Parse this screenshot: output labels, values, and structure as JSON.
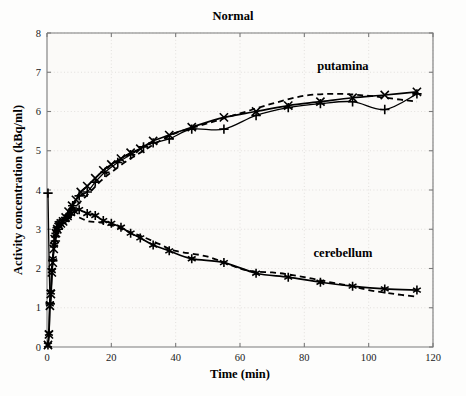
{
  "chart_data": {
    "type": "line",
    "title": "Normal",
    "xlabel": "Time (min)",
    "ylabel": "Activity concentration (kBq/ml)",
    "xlim": [
      0,
      120
    ],
    "ylim": [
      0,
      8
    ],
    "xticks": [
      0,
      20,
      40,
      60,
      80,
      100,
      120
    ],
    "yticks": [
      0,
      1,
      2,
      3,
      4,
      5,
      6,
      7,
      8
    ],
    "grid": true,
    "legend": "annotations-on-plot",
    "annotations": [
      {
        "text": "putamina",
        "x": 92,
        "y": 7.05
      },
      {
        "text": "cerebellum",
        "x": 92,
        "y": 2.3
      }
    ],
    "series": [
      {
        "name": "putamina measured (x)",
        "marker": "x",
        "linestyle": "solid",
        "x": [
          0.3,
          0.6,
          0.9,
          1.2,
          1.5,
          1.8,
          2.1,
          2.4,
          2.8,
          3.2,
          3.7,
          4.3,
          5.0,
          5.8,
          6.7,
          7.8,
          9.0,
          10.5,
          12.5,
          15,
          17.5,
          20,
          23,
          26,
          29,
          33,
          38,
          45,
          55,
          65,
          75,
          85,
          95,
          105,
          115
        ],
        "y": [
          0.05,
          0.32,
          1.05,
          1.35,
          1.9,
          2.15,
          2.5,
          2.75,
          2.9,
          3.0,
          3.1,
          3.15,
          3.2,
          3.3,
          3.45,
          3.6,
          3.75,
          3.95,
          4.1,
          4.3,
          4.5,
          4.65,
          4.8,
          4.95,
          5.05,
          5.25,
          5.4,
          5.6,
          5.85,
          6.0,
          6.15,
          6.25,
          6.35,
          6.42,
          6.5
        ]
      },
      {
        "name": "putamina model (+)",
        "marker": "+",
        "linestyle": "solid",
        "x": [
          0.3,
          1.0,
          1.8,
          2.6,
          3.5,
          4.5,
          6.0,
          8.0,
          10.0,
          12.5,
          15,
          18,
          22,
          26,
          30,
          33,
          38,
          45,
          55,
          65,
          75,
          85,
          95,
          105,
          115
        ],
        "y": [
          3.92,
          1.1,
          2.2,
          2.7,
          3.0,
          3.15,
          3.3,
          3.6,
          3.85,
          3.95,
          4.2,
          4.45,
          4.7,
          4.9,
          5.1,
          5.2,
          5.3,
          5.55,
          5.55,
          5.9,
          6.1,
          6.2,
          6.25,
          6.05,
          6.45
        ]
      },
      {
        "name": "putamina dashed fit",
        "marker": "none",
        "linestyle": "dashed",
        "x": [
          5,
          8,
          11,
          14,
          17,
          20,
          25,
          30,
          35,
          40,
          50,
          60,
          70,
          80,
          90,
          100,
          110,
          115
        ],
        "y": [
          3.25,
          3.5,
          3.75,
          4.0,
          4.25,
          4.45,
          4.75,
          5.0,
          5.25,
          5.45,
          5.7,
          5.95,
          6.2,
          6.4,
          6.45,
          6.4,
          6.3,
          6.25
        ]
      },
      {
        "name": "cerebellum measured (*)",
        "marker": "*",
        "linestyle": "solid",
        "x": [
          0.3,
          0.6,
          0.9,
          1.2,
          1.5,
          1.8,
          2.2,
          2.6,
          3.0,
          3.5,
          4.0,
          4.8,
          5.6,
          6.5,
          7.5,
          8.5,
          10,
          12.5,
          15,
          17.5,
          20,
          23,
          26,
          29,
          33,
          38,
          45,
          55,
          65,
          75,
          85,
          95,
          105,
          115
        ],
        "y": [
          0.05,
          0.35,
          1.1,
          1.4,
          1.95,
          2.25,
          2.6,
          2.85,
          3.0,
          3.1,
          3.15,
          3.2,
          3.25,
          3.3,
          3.4,
          3.45,
          3.5,
          3.4,
          3.35,
          3.22,
          3.15,
          3.05,
          2.9,
          2.78,
          2.6,
          2.45,
          2.25,
          2.15,
          1.88,
          1.78,
          1.65,
          1.55,
          1.48,
          1.45
        ]
      },
      {
        "name": "cerebellum dashed fit",
        "marker": "none",
        "linestyle": "dashed",
        "x": [
          10,
          13,
          16,
          20,
          25,
          30,
          35,
          40,
          50,
          60,
          65,
          70,
          75,
          80,
          85,
          90,
          95,
          100,
          108,
          115
        ],
        "y": [
          3.3,
          3.2,
          3.18,
          3.1,
          2.95,
          2.8,
          2.62,
          2.45,
          2.3,
          2.0,
          1.92,
          1.9,
          1.85,
          1.78,
          1.7,
          1.62,
          1.55,
          1.45,
          1.35,
          1.28
        ]
      }
    ]
  },
  "figure": {
    "title": "Normal",
    "xlabel": "Time (min)",
    "ylabel": "Activity concentration (kBq/ml)"
  }
}
